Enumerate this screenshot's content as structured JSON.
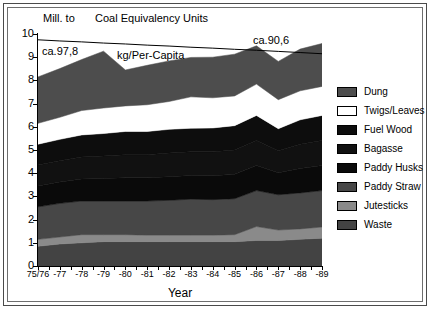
{
  "header": {
    "unit_label": "Mill. to",
    "title": "Coal Equivalency Units"
  },
  "axes": {
    "x_title": "Year",
    "y_ticks": [
      "10",
      "9",
      "8",
      "7",
      "6",
      "5",
      "4",
      "3",
      "2",
      "1",
      "0"
    ],
    "x_ticks": [
      "75/76",
      "-77",
      "-78",
      "-79",
      "-80",
      "-81",
      "-82",
      "-83",
      "-84",
      "-85",
      "-86",
      "-87",
      "-88",
      "-89"
    ]
  },
  "annotations": {
    "left_value": "ca.97,8",
    "right_value": "ca.90,6",
    "per_capita_label": "kg/Per-Capita"
  },
  "legend": {
    "items": [
      {
        "label": "Dung",
        "color": "#4d4d4d"
      },
      {
        "label": "Twigs/Leaves",
        "color": "#ffffff"
      },
      {
        "label": "Fuel Wood",
        "color": "#0d0d0d"
      },
      {
        "label": "Bagasse",
        "color": "#111111"
      },
      {
        "label": "Paddy Husks",
        "color": "#0a0a0a"
      },
      {
        "label": "Paddy Straw",
        "color": "#474747"
      },
      {
        "label": "Jutesticks",
        "color": "#8a8a8a"
      },
      {
        "label": "Waste",
        "color": "#434343"
      }
    ]
  },
  "chart_data": {
    "type": "area",
    "title": "Coal Equivalency Units",
    "xlabel": "Year",
    "ylabel": "Mill. to",
    "ylim": [
      0,
      10
    ],
    "xlim_categories": [
      "75/76",
      "-77",
      "-78",
      "-79",
      "-80",
      "-81",
      "-82",
      "-83",
      "-84",
      "-85",
      "-86",
      "-87",
      "-88",
      "-89"
    ],
    "stacked": true,
    "stack_order_bottom_to_top": [
      "Waste",
      "Jutesticks",
      "Paddy Straw",
      "Paddy Husks",
      "Bagasse",
      "Fuel Wood",
      "Twigs/Leaves",
      "Dung"
    ],
    "categories": [
      "75/76",
      "-77",
      "-78",
      "-79",
      "-80",
      "-81",
      "-82",
      "-83",
      "-84",
      "-85",
      "-86",
      "-87",
      "-88",
      "-89"
    ],
    "series": [
      {
        "name": "Waste",
        "color": "#434343",
        "values": [
          0.85,
          0.95,
          1.0,
          1.05,
          1.05,
          1.05,
          1.05,
          1.05,
          1.05,
          1.05,
          1.1,
          1.1,
          1.15,
          1.2
        ]
      },
      {
        "name": "Jutesticks",
        "color": "#8a8a8a",
        "values": [
          0.3,
          0.3,
          0.35,
          0.3,
          0.3,
          0.28,
          0.28,
          0.28,
          0.28,
          0.3,
          0.6,
          0.45,
          0.45,
          0.48
        ]
      },
      {
        "name": "Paddy Straw",
        "color": "#474747",
        "values": [
          1.4,
          1.45,
          1.45,
          1.45,
          1.45,
          1.47,
          1.5,
          1.55,
          1.53,
          1.55,
          1.55,
          1.52,
          1.55,
          1.57
        ]
      },
      {
        "name": "Paddy Husks",
        "color": "#0a0a0a",
        "values": [
          0.9,
          0.92,
          0.95,
          0.97,
          1.0,
          1.0,
          1.02,
          1.02,
          1.03,
          1.05,
          1.08,
          0.95,
          1.05,
          1.08
        ]
      },
      {
        "name": "Bagasse",
        "color": "#111111",
        "values": [
          0.9,
          0.92,
          0.95,
          0.97,
          1.0,
          1.0,
          1.02,
          1.02,
          1.03,
          1.05,
          1.08,
          0.95,
          1.05,
          1.08
        ]
      },
      {
        "name": "Fuel Wood",
        "color": "#0d0d0d",
        "values": [
          0.9,
          0.92,
          0.95,
          0.97,
          1.0,
          1.0,
          1.02,
          1.02,
          1.03,
          1.05,
          1.08,
          0.95,
          1.05,
          1.08
        ]
      },
      {
        "name": "Twigs/Leaves",
        "color": "#ffffff",
        "values": [
          0.9,
          0.95,
          1.05,
          1.1,
          1.1,
          1.15,
          1.2,
          1.35,
          1.3,
          1.28,
          1.35,
          1.25,
          1.25,
          1.25
        ]
      },
      {
        "name": "Dung",
        "color": "#4d4d4d",
        "values": [
          2.0,
          2.1,
          2.2,
          2.45,
          1.55,
          1.7,
          1.75,
          1.7,
          1.75,
          1.8,
          1.65,
          1.65,
          1.8,
          1.85
        ]
      }
    ],
    "cumulative_totals": [
      8.15,
      8.51,
      8.9,
      9.26,
      8.45,
      8.65,
      8.84,
      8.99,
      9.0,
      9.13,
      9.49,
      8.82,
      9.35,
      9.59
    ],
    "overlay_line": {
      "name": "kg/Per-Capita",
      "start_value": "ca.97,8",
      "end_value": "ca.90,6",
      "plotted_y": [
        9.75,
        9.7,
        9.66,
        9.61,
        9.57,
        9.52,
        9.48,
        9.43,
        9.39,
        9.34,
        9.3,
        9.25,
        9.2,
        9.15
      ]
    },
    "grid": false,
    "legend_position": "right"
  }
}
